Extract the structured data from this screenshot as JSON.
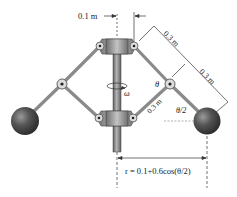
{
  "diagram": {
    "type": "mechanism",
    "labels": {
      "top_offset": "0.1 m",
      "upper_link_length": "0.3 m",
      "lower_link_length": "0.3 m",
      "inner_link_length": "0.3 m",
      "angle_theta": "θ",
      "angle_half_theta": "θ/2",
      "angular_velocity": "ω",
      "radius_formula": "r = 0.1+0.6cos(θ/2)"
    },
    "colors": {
      "link": "#8a8a8a",
      "collar": "#9a9a9a",
      "shaft": "#7d7d7d",
      "ball": "#4a4a4a",
      "dimension": "#333333"
    }
  }
}
